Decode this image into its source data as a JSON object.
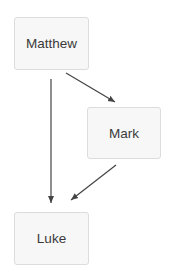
{
  "diagram": {
    "type": "directed-graph",
    "nodes": [
      {
        "id": "matthew",
        "label": "Matthew"
      },
      {
        "id": "mark",
        "label": "Mark"
      },
      {
        "id": "luke",
        "label": "Luke"
      }
    ],
    "edges": [
      {
        "from": "matthew",
        "to": "mark"
      },
      {
        "from": "matthew",
        "to": "luke"
      },
      {
        "from": "mark",
        "to": "luke"
      }
    ],
    "colors": {
      "node_fill": "#f7f7f7",
      "node_border": "#dcdcdc",
      "edge": "#444444",
      "text": "#3a3a3a"
    }
  }
}
